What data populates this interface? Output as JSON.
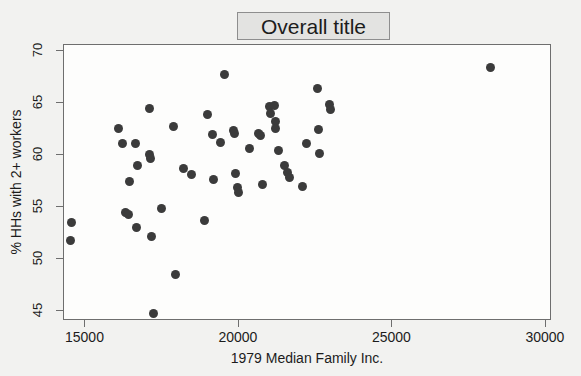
{
  "chart_data": {
    "type": "scatter",
    "title": "Overall title",
    "xlabel": "1979 Median Family Inc.",
    "ylabel": "% HHs with 2+ workers",
    "xlim": [
      14300,
      30200
    ],
    "ylim": [
      44.0,
      70.6
    ],
    "xticks": [
      15000,
      20000,
      25000,
      30000
    ],
    "yticks": [
      45,
      50,
      55,
      60,
      65,
      70
    ],
    "xtick_labels": [
      "15000",
      "20000",
      "25000",
      "30000"
    ],
    "ytick_labels": [
      "45",
      "50",
      "55",
      "60",
      "65",
      "70"
    ],
    "grid": false,
    "legend": false,
    "marker_color": "#3b3b3b",
    "marker_size": 9,
    "plot_background": "#fdfdfc",
    "figure_background": "#f2f2f0",
    "points": [
      {
        "x": 14550,
        "y": 53.5
      },
      {
        "x": 14520,
        "y": 51.8
      },
      {
        "x": 16070,
        "y": 62.6
      },
      {
        "x": 16190,
        "y": 61.1
      },
      {
        "x": 16320,
        "y": 54.5
      },
      {
        "x": 16400,
        "y": 54.3
      },
      {
        "x": 16450,
        "y": 57.4
      },
      {
        "x": 16620,
        "y": 61.1
      },
      {
        "x": 16700,
        "y": 59.0
      },
      {
        "x": 16660,
        "y": 53.0
      },
      {
        "x": 17080,
        "y": 64.5
      },
      {
        "x": 17100,
        "y": 60.0
      },
      {
        "x": 17130,
        "y": 59.7
      },
      {
        "x": 17150,
        "y": 52.1
      },
      {
        "x": 17230,
        "y": 44.7
      },
      {
        "x": 17480,
        "y": 54.8
      },
      {
        "x": 17880,
        "y": 62.7
      },
      {
        "x": 17940,
        "y": 48.5
      },
      {
        "x": 18180,
        "y": 58.7
      },
      {
        "x": 18440,
        "y": 58.1
      },
      {
        "x": 18960,
        "y": 63.9
      },
      {
        "x": 18870,
        "y": 53.7
      },
      {
        "x": 19150,
        "y": 62.0
      },
      {
        "x": 19180,
        "y": 57.6
      },
      {
        "x": 19400,
        "y": 61.2
      },
      {
        "x": 19540,
        "y": 67.8
      },
      {
        "x": 19830,
        "y": 62.4
      },
      {
        "x": 19870,
        "y": 62.1
      },
      {
        "x": 19900,
        "y": 58.2
      },
      {
        "x": 19960,
        "y": 56.9
      },
      {
        "x": 19980,
        "y": 56.4
      },
      {
        "x": 20350,
        "y": 60.6
      },
      {
        "x": 20640,
        "y": 62.1
      },
      {
        "x": 20690,
        "y": 61.9
      },
      {
        "x": 20760,
        "y": 57.2
      },
      {
        "x": 20980,
        "y": 64.7
      },
      {
        "x": 21020,
        "y": 64.0
      },
      {
        "x": 21150,
        "y": 64.8
      },
      {
        "x": 21180,
        "y": 63.2
      },
      {
        "x": 21200,
        "y": 62.6
      },
      {
        "x": 21280,
        "y": 60.4
      },
      {
        "x": 21500,
        "y": 59.0
      },
      {
        "x": 21590,
        "y": 58.3
      },
      {
        "x": 21640,
        "y": 57.8
      },
      {
        "x": 22060,
        "y": 57.0
      },
      {
        "x": 22210,
        "y": 61.1
      },
      {
        "x": 22550,
        "y": 66.4
      },
      {
        "x": 22600,
        "y": 62.5
      },
      {
        "x": 22620,
        "y": 60.1
      },
      {
        "x": 22960,
        "y": 64.9
      },
      {
        "x": 22990,
        "y": 64.4
      },
      {
        "x": 28180,
        "y": 68.4
      }
    ]
  },
  "figure": {
    "title_text": "Overall title",
    "x_axis_title": "1979 Median Family Inc.",
    "y_axis_title": "% HHs with 2+ workers"
  }
}
